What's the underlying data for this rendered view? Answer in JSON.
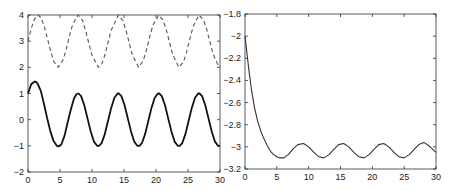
{
  "chart_data": [
    {
      "type": "line",
      "title": "",
      "xlabel": "",
      "ylabel": "",
      "xlim": [
        0,
        30
      ],
      "ylim": [
        -2,
        4
      ],
      "xticks": [
        0,
        5,
        10,
        15,
        20,
        25,
        30
      ],
      "yticks": [
        -2,
        -1,
        0,
        1,
        2,
        3,
        4
      ],
      "grid": false,
      "legend": null,
      "series": [
        {
          "name": "solid",
          "style": "solid",
          "color": "#111111",
          "x": [
            0,
            0.5,
            1.0,
            1.2,
            1.5,
            2,
            2.5,
            3,
            3.5,
            4,
            4.5,
            4.8,
            5.2,
            5.7,
            6.2,
            6.7,
            7.2,
            7.6,
            7.9,
            8.3,
            8.8,
            9.3,
            9.8,
            10.3,
            10.8,
            11.1,
            11.5,
            12,
            12.5,
            13,
            13.5,
            14,
            14.2,
            14.6,
            15.1,
            15.6,
            16.1,
            16.6,
            17.1,
            17.4,
            17.8,
            18.3,
            18.8,
            19.3,
            19.8,
            20.3,
            20.5,
            20.9,
            21.4,
            21.9,
            22.4,
            22.9,
            23.4,
            23.7,
            24.1,
            24.6,
            25.1,
            25.6,
            26.1,
            26.6,
            26.8,
            27.2,
            27.7,
            28.2,
            28.7,
            29.2,
            29.7,
            30
          ],
          "y": [
            1.0,
            1.35,
            1.45,
            1.45,
            1.38,
            1.1,
            0.6,
            0.05,
            -0.45,
            -0.82,
            -1.0,
            -1.02,
            -0.95,
            -0.62,
            -0.1,
            0.4,
            0.82,
            0.98,
            1.0,
            0.9,
            0.55,
            0.05,
            -0.45,
            -0.84,
            -1.0,
            -1.0,
            -0.9,
            -0.55,
            -0.05,
            0.45,
            0.84,
            1.0,
            1.0,
            0.9,
            0.55,
            0.05,
            -0.45,
            -0.84,
            -1.0,
            -1.0,
            -0.9,
            -0.55,
            -0.05,
            0.45,
            0.84,
            1.0,
            1.0,
            0.9,
            0.55,
            0.05,
            -0.45,
            -0.84,
            -1.0,
            -1.0,
            -0.9,
            -0.55,
            -0.05,
            0.45,
            0.84,
            1.0,
            1.0,
            0.9,
            0.55,
            0.05,
            -0.45,
            -0.84,
            -1.0,
            -1.0
          ]
        },
        {
          "name": "dashed",
          "style": "dashed",
          "color": "#555555",
          "x": [
            0,
            0.5,
            1,
            1.57,
            2,
            2.5,
            3,
            3.5,
            4,
            4.71,
            5.5,
            6,
            6.5,
            7,
            7.85,
            8.5,
            9,
            9.5,
            10,
            11.0,
            11.5,
            12,
            12.5,
            13,
            14.14,
            14.8,
            15.3,
            15.8,
            16.3,
            17.28,
            18,
            18.5,
            19,
            19.5,
            20.42,
            21.1,
            21.6,
            22.1,
            22.6,
            23.56,
            24.3,
            24.8,
            25.3,
            25.8,
            26.7,
            27.4,
            27.9,
            28.4,
            28.9,
            29.85,
            30
          ],
          "y": [
            3.0,
            3.48,
            3.84,
            4.0,
            3.91,
            3.6,
            3.14,
            2.65,
            2.24,
            2.0,
            2.29,
            2.72,
            3.22,
            3.66,
            4.0,
            3.8,
            3.41,
            2.92,
            2.46,
            2.0,
            2.12,
            2.46,
            2.94,
            3.42,
            4.0,
            3.79,
            3.43,
            2.95,
            2.48,
            2.0,
            2.25,
            2.66,
            3.15,
            3.6,
            4.0,
            3.81,
            3.45,
            2.97,
            2.5,
            2.0,
            2.2,
            2.6,
            3.1,
            3.55,
            4.0,
            3.82,
            3.47,
            2.98,
            2.52,
            2.0,
            2.0
          ]
        }
      ]
    },
    {
      "type": "line",
      "title": "",
      "xlabel": "",
      "ylabel": "",
      "xlim": [
        0,
        30
      ],
      "ylim": [
        -3.2,
        -1.8
      ],
      "xticks": [
        0,
        5,
        10,
        15,
        20,
        25,
        30
      ],
      "yticks": [
        -3.2,
        -3,
        -2.8,
        -2.6,
        -2.4,
        -2.2,
        -2,
        -1.8
      ],
      "grid": false,
      "legend": null,
      "series": [
        {
          "name": "solid",
          "style": "solid",
          "color": "#333333",
          "x": [
            0,
            0.3,
            0.6,
            1,
            1.5,
            2,
            2.5,
            3,
            3.5,
            4,
            4.5,
            5,
            5.5,
            6.1,
            6.8,
            7.5,
            8.3,
            9.2,
            10,
            10.8,
            11.6,
            12.4,
            13.2,
            14,
            14.7,
            15.5,
            16.3,
            17.1,
            17.9,
            18.7,
            19.5,
            20.3,
            21.0,
            21.8,
            22.6,
            23.4,
            24.2,
            25.0,
            25.8,
            26.6,
            27.3,
            28.1,
            28.9,
            29.6,
            30
          ],
          "y": [
            -2.0,
            -2.15,
            -2.3,
            -2.48,
            -2.65,
            -2.77,
            -2.86,
            -2.93,
            -2.99,
            -3.04,
            -3.07,
            -3.09,
            -3.1,
            -3.1,
            -3.07,
            -3.02,
            -2.98,
            -2.97,
            -3.0,
            -3.05,
            -3.09,
            -3.1,
            -3.07,
            -3.02,
            -2.98,
            -2.97,
            -3.0,
            -3.05,
            -3.09,
            -3.1,
            -3.07,
            -3.02,
            -2.98,
            -2.97,
            -3.0,
            -3.05,
            -3.09,
            -3.1,
            -3.07,
            -3.02,
            -2.98,
            -2.96,
            -2.99,
            -3.03,
            -3.05
          ]
        }
      ]
    }
  ],
  "plots": [
    {
      "x_tick_labels": [
        "0",
        "5",
        "10",
        "15",
        "20",
        "25",
        "30"
      ],
      "y_tick_labels": [
        "-2",
        "-1",
        "0",
        "1",
        "2",
        "3",
        "4"
      ]
    },
    {
      "x_tick_labels": [
        "0",
        "5",
        "10",
        "15",
        "20",
        "25",
        "30"
      ],
      "y_tick_labels": [
        "-3.2",
        "-3",
        "-2.8",
        "-2.6",
        "-2.4",
        "-2.2",
        "-2",
        "-1.8"
      ]
    }
  ]
}
